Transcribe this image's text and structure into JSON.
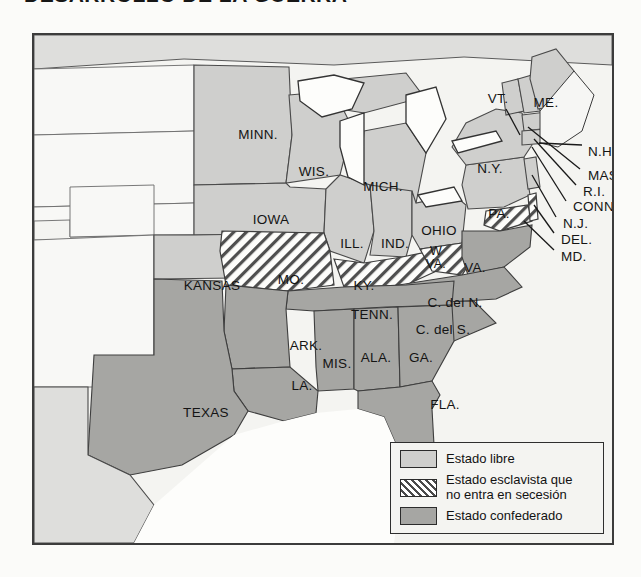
{
  "page": {
    "title_fragment": "DESARROLLO DE LA GUERRA"
  },
  "map": {
    "name": "mapa-estados-guerra-civil",
    "background_color": "#f2f2ef",
    "border_color": "#3c3c3c",
    "fills": {
      "free_state": "#cfcfcd",
      "confederate_state": "#a6a6a3",
      "territory": "#f7f7f4",
      "water": "#ffffff",
      "mexico": "#dedede"
    },
    "labels": [
      {
        "id": "minn",
        "text": "MINN.",
        "x": 224,
        "y": 100,
        "size": "lg"
      },
      {
        "id": "wis",
        "text": "WIS.",
        "x": 280,
        "y": 137,
        "size": "lg"
      },
      {
        "id": "mich",
        "text": "MICH.",
        "x": 349,
        "y": 152,
        "size": "lg"
      },
      {
        "id": "iowa",
        "text": "IOWA",
        "x": 237,
        "y": 185,
        "size": "lg"
      },
      {
        "id": "ill",
        "text": "ILL.",
        "x": 318,
        "y": 209,
        "size": "lg"
      },
      {
        "id": "ind",
        "text": "IND.",
        "x": 361,
        "y": 209,
        "size": "lg"
      },
      {
        "id": "ohio",
        "text": "OHIO",
        "x": 405,
        "y": 196,
        "size": "lg"
      },
      {
        "id": "pa",
        "text": "PA.",
        "x": 465,
        "y": 179,
        "size": "lg"
      },
      {
        "id": "ny",
        "text": "N.Y.",
        "x": 456,
        "y": 134,
        "size": "lg"
      },
      {
        "id": "vt",
        "text": "VT.",
        "x": 464,
        "y": 64,
        "size": "lg"
      },
      {
        "id": "me",
        "text": "ME.",
        "x": 512,
        "y": 68,
        "size": "lg"
      },
      {
        "id": "nh",
        "text": "N.H.",
        "x": 554,
        "y": 117,
        "size": "lg",
        "align": "left"
      },
      {
        "id": "mass",
        "text": "MASS.",
        "x": 554,
        "y": 141,
        "size": "lg",
        "align": "left"
      },
      {
        "id": "ri",
        "text": "R.I.",
        "x": 549,
        "y": 157,
        "size": "lg",
        "align": "left"
      },
      {
        "id": "conn",
        "text": "CONN.",
        "x": 539,
        "y": 172,
        "size": "lg",
        "align": "left"
      },
      {
        "id": "nj",
        "text": "N.J.",
        "x": 529,
        "y": 189,
        "size": "lg",
        "align": "left"
      },
      {
        "id": "del",
        "text": "DEL.",
        "x": 527,
        "y": 205,
        "size": "lg",
        "align": "left"
      },
      {
        "id": "md",
        "text": "MD.",
        "x": 527,
        "y": 222,
        "size": "lg",
        "align": "left"
      },
      {
        "id": "kansas",
        "text": "KANSAS",
        "x": 178,
        "y": 251,
        "size": "lg"
      },
      {
        "id": "mo",
        "text": "MO.",
        "x": 257,
        "y": 245,
        "size": "lg"
      },
      {
        "id": "ky",
        "text": "KY.",
        "x": 330,
        "y": 251,
        "size": "lg"
      },
      {
        "id": "wva",
        "text": "W\nVA.",
        "x": 402,
        "y": 223,
        "size": "md"
      },
      {
        "id": "va",
        "text": "VA.",
        "x": 441,
        "y": 233,
        "size": "lg"
      },
      {
        "id": "tenn",
        "text": "TENN.",
        "x": 338,
        "y": 280,
        "size": "lg"
      },
      {
        "id": "cdeln",
        "text": "C. del N.",
        "x": 421,
        "y": 268,
        "size": "lg"
      },
      {
        "id": "cdels",
        "text": "C. del S.",
        "x": 409,
        "y": 295,
        "size": "lg"
      },
      {
        "id": "ark",
        "text": "ARK.",
        "x": 272,
        "y": 311,
        "size": "lg"
      },
      {
        "id": "mis",
        "text": "MIS.",
        "x": 303,
        "y": 329,
        "size": "lg"
      },
      {
        "id": "ala",
        "text": "ALA.",
        "x": 342,
        "y": 323,
        "size": "lg"
      },
      {
        "id": "ga",
        "text": "GA.",
        "x": 387,
        "y": 323,
        "size": "lg"
      },
      {
        "id": "la",
        "text": "LA.",
        "x": 268,
        "y": 351,
        "size": "lg"
      },
      {
        "id": "texas",
        "text": "TEXAS",
        "x": 172,
        "y": 378,
        "size": "lg"
      },
      {
        "id": "fla",
        "text": "FLA.",
        "x": 411,
        "y": 370,
        "size": "lg"
      }
    ]
  },
  "legend": {
    "name": "leyenda-mapa",
    "items": [
      {
        "id": "free",
        "swatch": "free-state-swatch",
        "label": "Estado libre"
      },
      {
        "id": "slave-union",
        "swatch": "slave-nonseceding-swatch",
        "label": "Estado esclavista que\nno entra en secesión"
      },
      {
        "id": "confederate",
        "swatch": "confederate-state-swatch",
        "label": "Estado confederado"
      }
    ]
  }
}
